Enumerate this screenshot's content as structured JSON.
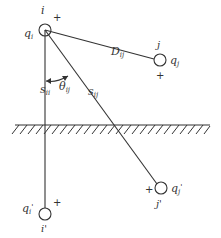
{
  "diagram": {
    "type": "charge-image-method",
    "colors": {
      "stroke": "#333333",
      "background": "#ffffff"
    },
    "nodes": {
      "i": {
        "label": "i",
        "charge": "q",
        "charge_sub": "i",
        "sign": "+"
      },
      "j": {
        "label": "j",
        "charge": "q",
        "charge_sub": "j",
        "sign": "+"
      },
      "i_img": {
        "label": "i'",
        "charge": "q",
        "charge_sub": "i",
        "charge_prime": "'",
        "sign": "+"
      },
      "j_img": {
        "label": "j'",
        "charge": "q",
        "charge_sub": "j",
        "charge_prime": "'",
        "sign": "+"
      }
    },
    "edges": {
      "D": {
        "symbol": "D",
        "sub": "ij"
      },
      "s_ii": {
        "symbol": "s",
        "sub": "ii"
      },
      "s_ij": {
        "symbol": "s",
        "sub": "ij"
      }
    },
    "angle": {
      "symbol": "θ",
      "sub": "ij"
    },
    "ground": {
      "label": "ground plane"
    }
  }
}
